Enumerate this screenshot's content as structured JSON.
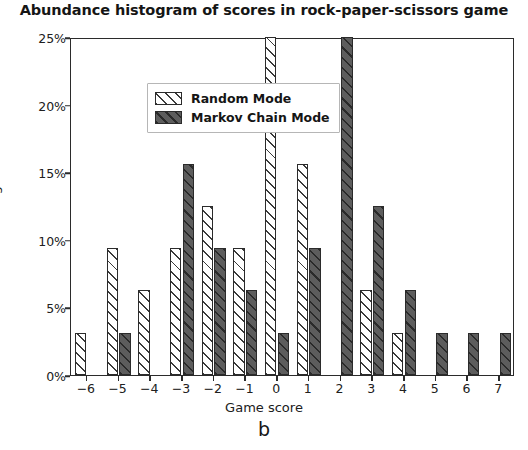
{
  "chart_data": {
    "type": "bar",
    "title": "Abundance histogram of scores in rock-paper-scissors game",
    "xlabel": "Game score",
    "ylabel": "Percentage",
    "categories": [
      "-6",
      "-5",
      "-4",
      "-3",
      "-2",
      "-1",
      "0",
      "1",
      "2",
      "3",
      "4",
      "5",
      "6",
      "7"
    ],
    "series": [
      {
        "name": "Random Mode",
        "color": "#ffffff",
        "hatch": "diagonal",
        "values": [
          3.1,
          9.4,
          6.3,
          9.4,
          12.5,
          9.4,
          25.0,
          15.6,
          0,
          6.3,
          3.1,
          0,
          0,
          0
        ]
      },
      {
        "name": "Markov Chain Mode",
        "color": "#5d5d5d",
        "hatch": "diagonal",
        "values": [
          0,
          3.1,
          0,
          15.6,
          9.4,
          6.3,
          3.1,
          9.4,
          25.0,
          12.5,
          6.3,
          3.1,
          3.1,
          3.1
        ]
      }
    ],
    "ylim": [
      0,
      25
    ],
    "yticks": [
      0,
      5,
      10,
      15,
      20,
      25
    ],
    "ytick_labels": [
      "0%",
      "5%",
      "10%",
      "15%",
      "20%",
      "25%"
    ],
    "grid": false,
    "legend_position": "upper left"
  },
  "panel": {
    "letter": "b"
  }
}
